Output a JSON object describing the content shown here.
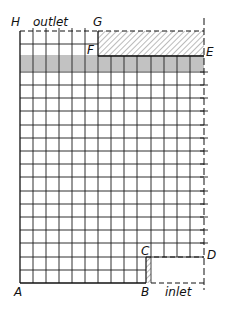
{
  "figure": {
    "type": "finite-difference grid diagram",
    "points": {
      "A": "A",
      "B": "B",
      "C": "C",
      "D": "D",
      "E": "E",
      "F": "F",
      "G": "G",
      "H": "H"
    },
    "labels": {
      "outlet": "outlet",
      "inlet": "inlet"
    },
    "colors": {
      "line": "#1a1a1a",
      "hatch": "#444444",
      "background": "#ffffff"
    }
  }
}
